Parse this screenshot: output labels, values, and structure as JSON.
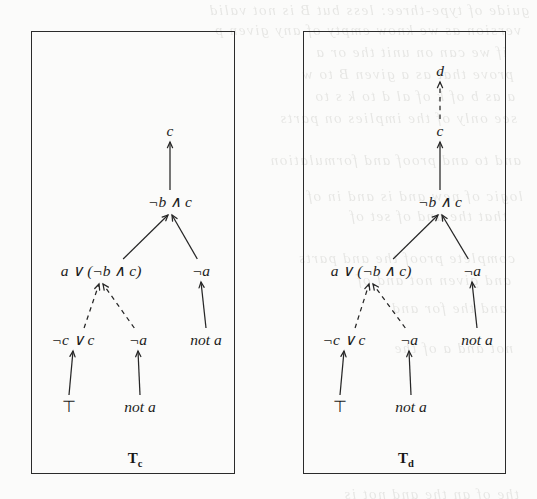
{
  "figure": {
    "kind": "proof-tree-pair",
    "background_color": "#fbfbfa",
    "ink_color": "#262626",
    "panels": [
      {
        "id": "tree-c",
        "caption_base": "T",
        "caption_sub": "c",
        "frame": {
          "x": 31,
          "y": 31,
          "w": 204,
          "h": 443
        },
        "nodes": [
          {
            "id": "c-root",
            "label": "c",
            "x": 169,
            "y": 135,
            "style": "italic"
          },
          {
            "id": "nb-and-c",
            "label": "¬b ∧ c",
            "x": 169,
            "y": 206,
            "style": "italic"
          },
          {
            "id": "a-or",
            "label": "a ∨ (¬b ∧ c)",
            "x": 100,
            "y": 275,
            "style": "italic"
          },
          {
            "id": "not-a-r",
            "label": "¬a",
            "x": 200,
            "y": 275,
            "style": "italic"
          },
          {
            "id": "nc-or-c",
            "label": "¬c ∨ c",
            "x": 72,
            "y": 344,
            "style": "italic"
          },
          {
            "id": "neg-a",
            "label": "¬a",
            "x": 137,
            "y": 344,
            "style": "italic"
          },
          {
            "id": "not-a-1",
            "label": "not a",
            "x": 205,
            "y": 344,
            "style": "italic"
          },
          {
            "id": "top",
            "label": "⊤",
            "x": 68,
            "y": 411,
            "style": "upright"
          },
          {
            "id": "not-a-2",
            "label": "not a",
            "x": 139,
            "y": 411,
            "style": "italic"
          }
        ],
        "edges": [
          {
            "from": "nb-and-c",
            "to": "c-root",
            "kind": "solid",
            "shape": "vertical"
          },
          {
            "from": "a-or",
            "to": "nb-and-c",
            "kind": "solid",
            "shape": "diagonal"
          },
          {
            "from": "not-a-r",
            "to": "nb-and-c",
            "kind": "solid",
            "shape": "diagonal"
          },
          {
            "from": "nc-or-c",
            "to": "a-or",
            "kind": "dashed",
            "shape": "diagonal"
          },
          {
            "from": "neg-a",
            "to": "a-or",
            "kind": "dashed",
            "shape": "diagonal"
          },
          {
            "from": "not-a-1",
            "to": "not-a-r",
            "kind": "solid",
            "shape": "vertical"
          },
          {
            "from": "top",
            "to": "nc-or-c",
            "kind": "solid",
            "shape": "vertical"
          },
          {
            "from": "not-a-2",
            "to": "neg-a",
            "kind": "solid",
            "shape": "vertical"
          }
        ],
        "caption_pos": {
          "x": 134,
          "y": 462
        }
      },
      {
        "id": "tree-d",
        "caption_base": "T",
        "caption_sub": "d",
        "frame": {
          "x": 303,
          "y": 31,
          "w": 203,
          "h": 443
        },
        "nodes": [
          {
            "id": "d-root",
            "label": "d",
            "x": 439,
            "y": 75,
            "style": "italic"
          },
          {
            "id": "c-root",
            "label": "c",
            "x": 439,
            "y": 135,
            "style": "italic"
          },
          {
            "id": "nb-and-c",
            "label": "¬b ∧ c",
            "x": 439,
            "y": 206,
            "style": "italic"
          },
          {
            "id": "a-or",
            "label": "a ∨ (¬b ∧ c)",
            "x": 370,
            "y": 275,
            "style": "italic"
          },
          {
            "id": "not-a-r",
            "label": "¬a",
            "x": 471,
            "y": 275,
            "style": "italic"
          },
          {
            "id": "nc-or-c",
            "label": "¬c ∨ c",
            "x": 343,
            "y": 344,
            "style": "italic"
          },
          {
            "id": "neg-a",
            "label": "¬a",
            "x": 408,
            "y": 344,
            "style": "italic"
          },
          {
            "id": "not-a-1",
            "label": "not a",
            "x": 476,
            "y": 344,
            "style": "italic"
          },
          {
            "id": "top",
            "label": "⊤",
            "x": 339,
            "y": 411,
            "style": "upright"
          },
          {
            "id": "not-a-2",
            "label": "not a",
            "x": 410,
            "y": 411,
            "style": "italic"
          }
        ],
        "edges": [
          {
            "from": "c-root",
            "to": "d-root",
            "kind": "dashed",
            "shape": "vertical"
          },
          {
            "from": "nb-and-c",
            "to": "c-root",
            "kind": "solid",
            "shape": "vertical"
          },
          {
            "from": "a-or",
            "to": "nb-and-c",
            "kind": "solid",
            "shape": "diagonal"
          },
          {
            "from": "not-a-r",
            "to": "nb-and-c",
            "kind": "solid",
            "shape": "diagonal"
          },
          {
            "from": "nc-or-c",
            "to": "a-or",
            "kind": "dashed",
            "shape": "diagonal"
          },
          {
            "from": "neg-a",
            "to": "a-or",
            "kind": "dashed",
            "shape": "diagonal"
          },
          {
            "from": "not-a-1",
            "to": "not-a-r",
            "kind": "solid",
            "shape": "vertical"
          },
          {
            "from": "top",
            "to": "nc-or-c",
            "kind": "solid",
            "shape": "vertical"
          },
          {
            "from": "not-a-2",
            "to": "neg-a",
            "kind": "solid",
            "shape": "vertical"
          }
        ],
        "caption_pos": {
          "x": 405,
          "y": 462
        }
      }
    ]
  },
  "showthrough": {
    "note": "faint mirrored bleed-through text from the reverse side of the scanned page",
    "lines": [
      {
        "x": 8,
        "y": 2,
        "text": "guide of type-three: less but B is not valid"
      },
      {
        "x": 16,
        "y": 22,
        "text": "version as we know empty of any given p"
      },
      {
        "x": 30,
        "y": 44,
        "text": "if we can on unit the    or a"
      },
      {
        "x": 24,
        "y": 66,
        "text": "prove that as a given  B    to    w"
      },
      {
        "x": 22,
        "y": 88,
        "text": "a as b of k  of  al   d  to  k  s  to"
      },
      {
        "x": 20,
        "y": 110,
        "text": "see   only  of   the  implies   on  parts"
      },
      {
        "x": 16,
        "y": 152,
        "text": "and  to    and    proof  and     formulation"
      },
      {
        "x": 14,
        "y": 188,
        "text": "logic of   new  and   is  and  in  of"
      },
      {
        "x": 30,
        "y": 208,
        "text": "  that  the  and   of   set   of"
      },
      {
        "x": 22,
        "y": 250,
        "text": "complete  proof  the  and  parts"
      },
      {
        "x": 26,
        "y": 272,
        "text": "  and  given   not  and  of"
      },
      {
        "x": 30,
        "y": 300,
        "text": "  and  the   for   and "
      },
      {
        "x": 24,
        "y": 340,
        "text": "  not    and  a   of  the"
      },
      {
        "x": 18,
        "y": 486,
        "text": "the   of  an   the  and   not  is"
      }
    ]
  }
}
